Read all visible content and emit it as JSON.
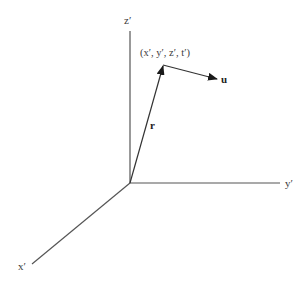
{
  "diagram": {
    "type": "3d-coordinate-frame",
    "axes": {
      "x": {
        "label": "x′"
      },
      "y": {
        "label": "y′"
      },
      "z": {
        "label": "z′"
      }
    },
    "point": {
      "label": "(x′, y′, z′, t′)"
    },
    "vectors": {
      "position": {
        "label": "r"
      },
      "velocity": {
        "label": "u"
      }
    },
    "colors": {
      "line": "#555555",
      "arrow": "#1a1a1a",
      "text": "#3a3a3a"
    }
  }
}
